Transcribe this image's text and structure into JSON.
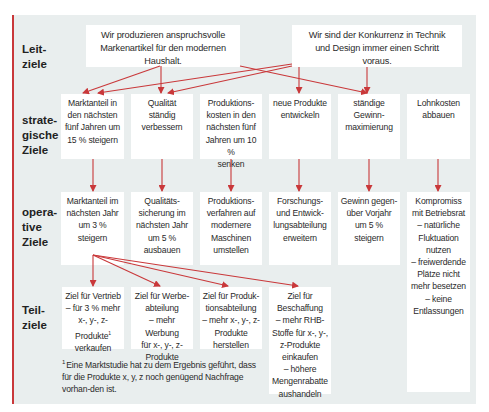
{
  "colors": {
    "accent": "#c9383a",
    "panel_bg": "#e9eeee",
    "box_bg": "#ffffff"
  },
  "row_labels": {
    "leitziele": "Leit-\nziele",
    "strategische": "strate-\ngische\nZiele",
    "operative": "opera-\ntive\nZiele",
    "teilziele": "Teil-\nziele"
  },
  "leitziele": [
    {
      "text": "Wir produzieren anspruchsvolle\nMarkenartikel für den modernen\nHaushalt."
    },
    {
      "text": "Wir sind der Konkurrenz in Technik\nund Design immer einen Schritt\nvoraus."
    }
  ],
  "strategische_ziele": [
    {
      "text": "Marktanteil in\nden nächsten\nfünf Jahren um\n15 % steigern"
    },
    {
      "text": "Qualität\nständig\nverbessern"
    },
    {
      "text": "Produktions-\nkosten in den\nnächsten fünf\nJahren um 10 %\nsenken"
    },
    {
      "text": "neue Produkte\nentwickeln"
    },
    {
      "text": "ständige\nGewinn-\nmaximierung"
    },
    {
      "text": "Lohnkosten\nabbauen"
    }
  ],
  "operative_ziele": [
    {
      "text": "Marktanteil im\nnächsten Jahr\num 3 %\nsteigern"
    },
    {
      "text": "Qualitäts-\nsicherung im\nnächsten Jahr\num 5 %\nausbauen"
    },
    {
      "text": "Produktions-\nverfahren auf\nmodernere\nMaschinen\numstellen"
    },
    {
      "text": "Forschungs-\nund Entwick-\nlungsabteilung\nerweitern"
    },
    {
      "text": "Gewinn gegen-\nüber Vorjahr\num 5 %\nsteigern"
    },
    {
      "text": "Kompromiss\nmit Betriebsrat\n– natürliche\nFluktuation\nnutzen\n– freiwerdende\nPlätze nicht\nmehr besetzen\n– keine\nEntlassungen"
    }
  ],
  "teilziele": [
    {
      "text_a": "Ziel für Vertrieb\n– für 3 % mehr\nx-, y-, z-Produkte",
      "sup": "1",
      "text_b": "\nverkaufen"
    },
    {
      "text_a": "Ziel für Werbe-\nabteilung\n– mehr Werbung\nfür x-, y-, z-\nProdukte",
      "sup": "",
      "text_b": ""
    },
    {
      "text_a": "Ziel für Produk-\ntionsabteilung\n– mehr x-, y-, z-\nProdukte\nherstellen",
      "sup": "",
      "text_b": ""
    },
    {
      "text_a": "Ziel für\nBeschaffung\n– mehr RHB-\nStoffe für x-, y-,\nz-Produkte\neinkaufen\n– höhere\nMengenrabatte\naushandeln",
      "sup": "",
      "text_b": ""
    }
  ],
  "footnote": {
    "marker": "1",
    "text": "Eine Marktstudie hat zu dem Ergebnis geführt, dass für die Produkte x, y, z noch genügend Nachfrage vorhan-den ist."
  }
}
